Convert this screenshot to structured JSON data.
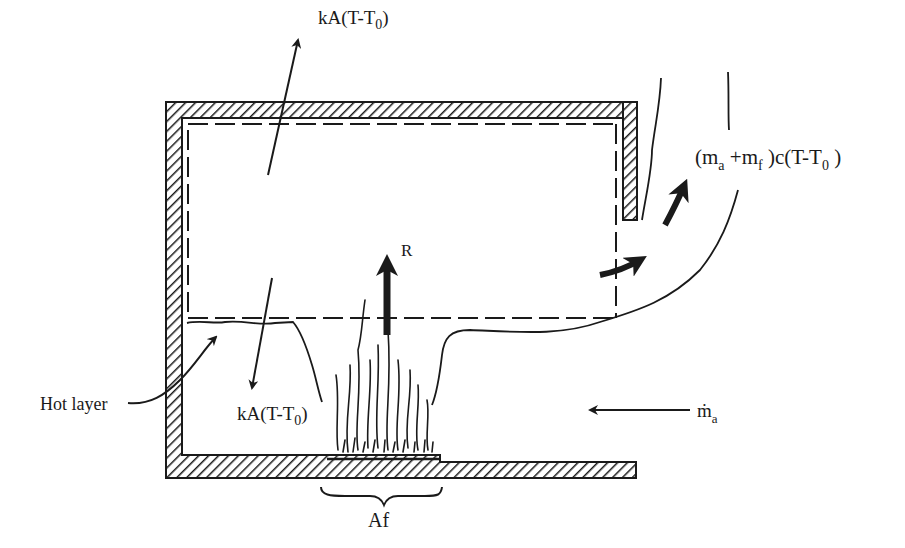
{
  "diagram": {
    "type": "compartment-fire-energy-balance",
    "colors": {
      "ink": "#1a1a1a",
      "background": "#ffffff"
    },
    "labels": {
      "ceiling_loss": {
        "main": "kA(T-T",
        "sub": "0",
        "close": ")"
      },
      "floor_loss": {
        "main": "kA(T-T",
        "sub": "0",
        "close": ")"
      },
      "outflow": {
        "open": "(m",
        "sub_a": "a",
        "plus": " +m",
        "sub_f": "f",
        "rest": " )c(T-T",
        "sub_0": "0",
        "close": " )"
      },
      "radiation": "R",
      "inflow": {
        "main": "ṁ",
        "sub": "a"
      },
      "hot_layer": "Hot layer",
      "fire_area": "Af"
    },
    "components": [
      "compartment-walls-hatched",
      "control-volume-dashed",
      "hot-layer-interface",
      "fire-plume",
      "fuel-bed",
      "door-opening",
      "outflow-plume"
    ]
  }
}
